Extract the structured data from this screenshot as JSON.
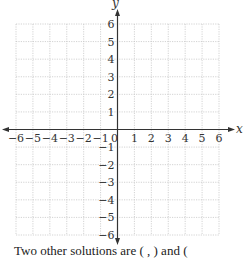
{
  "chart_data": {
    "type": "scatter",
    "title": "",
    "xlabel": "x",
    "ylabel": "y",
    "xlim": [
      -6,
      6
    ],
    "ylim": [
      -6,
      6
    ],
    "grid": true,
    "grid_style": "dotted",
    "x_ticks": [
      "-6",
      "-5",
      "-4",
      "-3",
      "-2",
      "-1",
      "0",
      "1",
      "2",
      "3",
      "4",
      "5",
      "6"
    ],
    "y_ticks": [
      "6",
      "5",
      "4",
      "3",
      "2",
      "1",
      "-1",
      "-2",
      "-3",
      "-4",
      "-5",
      "-6"
    ],
    "origin_label": "0",
    "series": [],
    "points": []
  },
  "labels": {
    "x_axis": "x",
    "y_axis": "y"
  },
  "colors": {
    "axis": "#333333",
    "grid": "#c8c8c8",
    "text": "#333333"
  },
  "caption": {
    "text": "Two other solutions are (   ,   ) and ("
  }
}
